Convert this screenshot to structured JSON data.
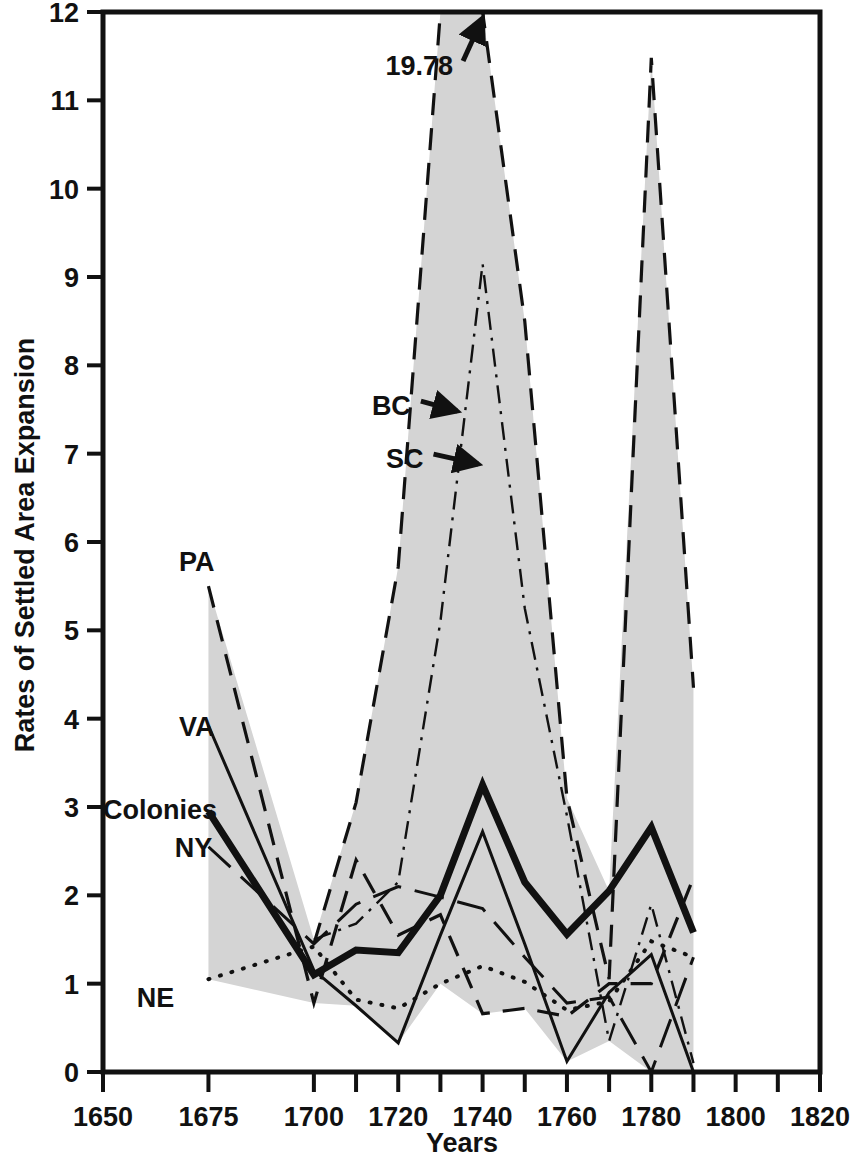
{
  "chart_data": {
    "type": "line",
    "title": "",
    "xlabel": "Years",
    "ylabel": "Rates of Settled Area Expansion",
    "xlim": [
      1650,
      1820
    ],
    "ylim": [
      0,
      12
    ],
    "grid": false,
    "legend_position": "inline-labels",
    "x_ticks": [
      1650,
      1675,
      1700,
      1720,
      1740,
      1760,
      1780,
      1800,
      1820
    ],
    "x_tick_labels": [
      "1650",
      "1675",
      "1700",
      "1720",
      "1740",
      "1760",
      "1780",
      "1800",
      "1820"
    ],
    "x_minor_ticks": [
      1710,
      1730,
      1750,
      1770,
      1790,
      1810
    ],
    "y_ticks": [
      0,
      1,
      2,
      3,
      4,
      5,
      6,
      7,
      8,
      9,
      10,
      11,
      12
    ],
    "y_tick_labels": [
      "0",
      "1",
      "2",
      "3",
      "4",
      "5",
      "6",
      "7",
      "8",
      "9",
      "10",
      "11",
      "12"
    ],
    "shaded_band": {
      "description": "grey band between highest and lowest colony series",
      "color": "#d4d4d4"
    },
    "annotations": [
      {
        "text": "19.78",
        "x": 1733,
        "y": 11.4,
        "arrow_to_x": 1740,
        "arrow_to_y": 12.0,
        "note": "BC peak value off the top of the chart"
      },
      {
        "text": "BC",
        "x": 1723,
        "y": 7.55,
        "arrow": true,
        "arrow_to_x": 1734,
        "arrow_to_y": 7.55
      },
      {
        "text": "SC",
        "x": 1726,
        "y": 6.95,
        "arrow": true,
        "arrow_to_x": 1739,
        "arrow_to_y": 6.95
      }
    ],
    "series": [
      {
        "name": "BC",
        "label": "BC",
        "style": "dashed",
        "stroke_width": 3.2,
        "color": "#111111",
        "x": [
          1700,
          1710,
          1720,
          1730,
          1740,
          1750,
          1760,
          1770,
          1780,
          1790
        ],
        "values": [
          1.45,
          3.05,
          5.72,
          12.75,
          19.78,
          8.5,
          3.1,
          1.05,
          11.48,
          4.35
        ]
      },
      {
        "name": "SC",
        "label": "SC",
        "style": "dash-dot",
        "stroke_width": 2.4,
        "color": "#111111",
        "x": [
          1700,
          1710,
          1720,
          1730,
          1740,
          1750,
          1760,
          1770,
          1780,
          1790
        ],
        "values": [
          1.5,
          1.68,
          2.15,
          5.1,
          9.15,
          5.25,
          2.9,
          0.35,
          1.9,
          0.1
        ]
      },
      {
        "name": "PA",
        "label": "PA",
        "style": "dashed",
        "stroke_width": 3.2,
        "color": "#111111",
        "x": [
          1675,
          1700,
          1710,
          1720,
          1730,
          1740,
          1750,
          1760,
          1770,
          1780,
          1790
        ],
        "values": [
          5.5,
          0.78,
          2.4,
          1.55,
          1.78,
          0.66,
          0.72,
          0.63,
          1.0,
          1.0,
          2.2
        ]
      },
      {
        "name": "VA",
        "label": "VA",
        "style": "solid",
        "stroke_width": 3.0,
        "color": "#111111",
        "x": [
          1675,
          1700,
          1710,
          1720,
          1730,
          1740,
          1750,
          1760,
          1770,
          1780,
          1790
        ],
        "values": [
          3.92,
          1.15,
          0.75,
          0.33,
          1.55,
          2.72,
          1.45,
          0.12,
          0.9,
          1.33,
          0.0
        ]
      },
      {
        "name": "Colonies",
        "label": "Colonies",
        "style": "solid-thick",
        "stroke_width": 7.0,
        "color": "#111111",
        "x": [
          1675,
          1700,
          1710,
          1720,
          1730,
          1740,
          1750,
          1760,
          1770,
          1780,
          1790
        ],
        "values": [
          2.95,
          1.1,
          1.38,
          1.35,
          2.0,
          3.25,
          2.15,
          1.56,
          2.05,
          2.77,
          1.58
        ]
      },
      {
        "name": "NY",
        "label": "NY",
        "style": "long-dash",
        "stroke_width": 3.0,
        "color": "#111111",
        "x": [
          1675,
          1700,
          1710,
          1720,
          1730,
          1740,
          1750,
          1760,
          1770,
          1780,
          1790
        ],
        "values": [
          2.55,
          1.45,
          1.9,
          2.1,
          1.98,
          1.85,
          1.3,
          0.78,
          0.85,
          0.0,
          1.3
        ]
      },
      {
        "name": "NE",
        "label": "NE",
        "style": "dotted",
        "stroke_width": 4.0,
        "color": "#111111",
        "x": [
          1675,
          1700,
          1710,
          1720,
          1730,
          1740,
          1750,
          1760,
          1770,
          1780,
          1790
        ],
        "values": [
          1.05,
          1.42,
          0.82,
          0.72,
          1.0,
          1.2,
          1.02,
          0.7,
          0.8,
          1.48,
          1.3
        ]
      }
    ],
    "series_labels": [
      {
        "name": "PA",
        "text": "PA",
        "x": 1668,
        "y": 5.78
      },
      {
        "name": "VA",
        "text": "VA",
        "x": 1668,
        "y": 3.92
      },
      {
        "name": "Colonies",
        "text": "Colonies",
        "x": 1650,
        "y": 2.98
      },
      {
        "name": "NY",
        "text": "NY",
        "x": 1667,
        "y": 2.55
      },
      {
        "name": "NE",
        "text": "NE",
        "x": 1658,
        "y": 0.85
      }
    ]
  }
}
